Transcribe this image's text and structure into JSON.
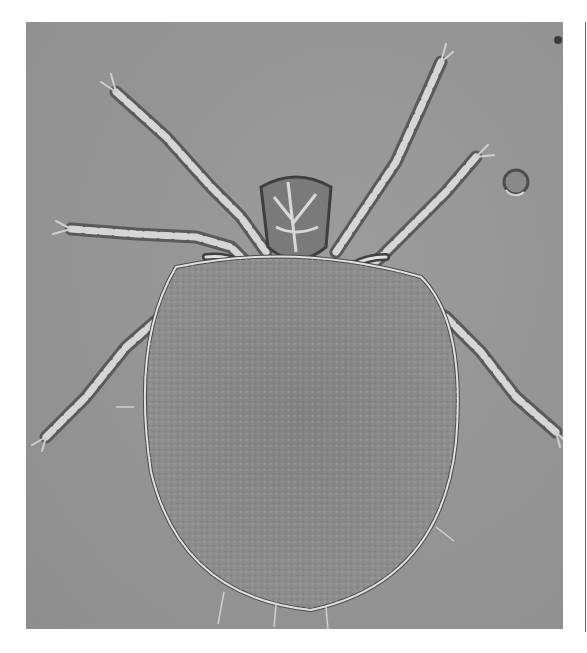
{
  "image": {
    "subject": "mite (microscopy, DIC)",
    "description": "Grayscale micrograph of an oval-bodied mite with eight segmented legs and central mouthparts on a gray background",
    "colors": {
      "page_background": "#ffffff",
      "field_background": "#959595",
      "body_fill": "#8a8a8a",
      "outline_light": "#e2e2e2",
      "outline_dark": "#4a4a4a"
    },
    "frame": {
      "left": 26,
      "top": 22,
      "width": 537,
      "height": 607
    }
  }
}
